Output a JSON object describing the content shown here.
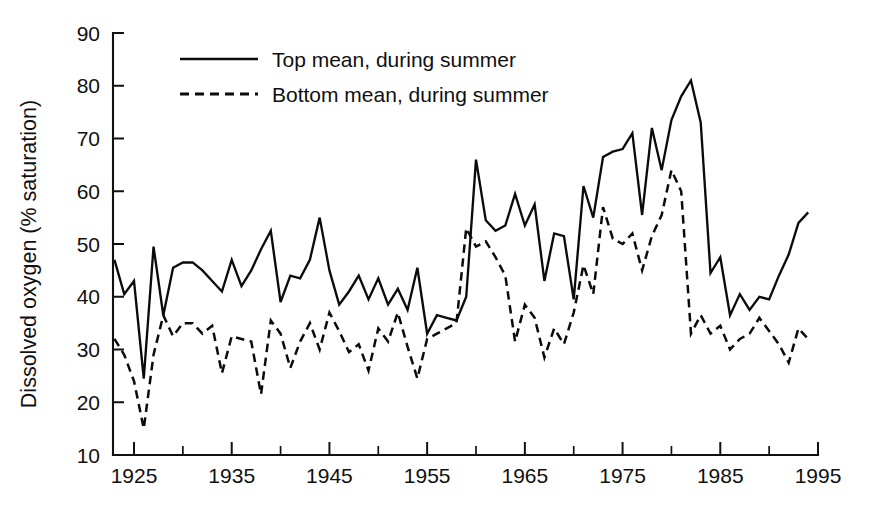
{
  "chart_data": {
    "type": "line",
    "title": "",
    "subtitle": "",
    "xlabel": "",
    "ylabel": "Dissolved oxygen (% saturation)",
    "xlim": [
      1921,
      1995
    ],
    "ylim": [
      10,
      90
    ],
    "grid": false,
    "legend_position": "top-left-inside",
    "y_ticks": [
      10,
      20,
      30,
      40,
      50,
      60,
      70,
      80,
      90
    ],
    "y_tick_labels": [
      "10",
      "20",
      "30",
      "40",
      "50",
      "60",
      "70",
      "80",
      "90"
    ],
    "x_ticks_major": [
      1925,
      1935,
      1945,
      1955,
      1965,
      1975,
      1985,
      1995
    ],
    "x_tick_labels": [
      "1925",
      "1935",
      "1945",
      "1955",
      "1965",
      "1975",
      "1985",
      "1995"
    ],
    "x_ticks_minor": [
      1930,
      1940,
      1950,
      1960,
      1970,
      1980,
      1990
    ],
    "x": [
      1923,
      1924,
      1925,
      1926,
      1927,
      1928,
      1929,
      1930,
      1931,
      1932,
      1933,
      1934,
      1935,
      1936,
      1937,
      1938,
      1939,
      1940,
      1941,
      1942,
      1943,
      1944,
      1945,
      1946,
      1947,
      1948,
      1949,
      1950,
      1951,
      1952,
      1953,
      1954,
      1955,
      1956,
      1957,
      1958,
      1959,
      1960,
      1961,
      1962,
      1963,
      1964,
      1965,
      1966,
      1967,
      1968,
      1969,
      1970,
      1971,
      1972,
      1973,
      1974,
      1975,
      1976,
      1977,
      1978,
      1979,
      1980,
      1981,
      1982,
      1983,
      1984,
      1985,
      1986,
      1987,
      1988,
      1989,
      1990,
      1991,
      1992,
      1993,
      1994
    ],
    "series": [
      {
        "name": "Top mean, during summer",
        "style": "solid",
        "color": "#0b0b0b",
        "values": [
          47.0,
          40.5,
          43.0,
          24.5,
          49.5,
          36.5,
          45.5,
          46.5,
          46.5,
          45.0,
          43.0,
          41.0,
          47.0,
          42.0,
          45.0,
          49.0,
          52.5,
          39.0,
          44.0,
          43.5,
          47.0,
          55.0,
          45.0,
          38.5,
          41.0,
          44.0,
          39.5,
          43.5,
          38.5,
          41.5,
          37.5,
          45.5,
          33.0,
          36.5,
          36.0,
          35.5,
          40.0,
          66.0,
          54.5,
          52.5,
          53.5,
          59.5,
          53.5,
          57.5,
          43.0,
          52.0,
          51.5,
          39.5,
          61.0,
          55.0,
          66.5,
          67.5,
          68.0,
          71.0,
          55.5,
          72.0,
          64.0,
          73.5,
          78.0,
          81.0,
          73.0,
          44.5,
          47.5,
          36.5,
          40.5,
          37.5,
          40.0,
          39.5,
          44.0,
          48.0,
          54.0,
          56.0
        ]
      },
      {
        "name": "Bottom mean, during summer",
        "style": "dashed",
        "color": "#0b0b0b",
        "values": [
          32.0,
          29.0,
          24.0,
          15.0,
          29.0,
          36.5,
          32.5,
          35.0,
          35.0,
          33.0,
          34.5,
          25.5,
          32.5,
          32.0,
          31.5,
          21.5,
          35.5,
          33.0,
          26.5,
          31.5,
          35.0,
          30.0,
          37.0,
          33.5,
          29.5,
          31.0,
          26.0,
          34.0,
          31.5,
          37.0,
          30.5,
          24.5,
          32.0,
          33.0,
          34.0,
          35.0,
          53.0,
          49.5,
          50.5,
          47.5,
          44.0,
          31.5,
          38.5,
          36.0,
          28.5,
          34.0,
          31.0,
          37.0,
          46.0,
          40.5,
          57.0,
          51.0,
          50.0,
          52.0,
          45.0,
          51.5,
          55.5,
          64.0,
          60.0,
          33.0,
          36.5,
          33.0,
          34.5,
          30.0,
          32.0,
          33.0,
          36.0,
          33.5,
          31.0,
          27.5,
          34.0,
          32.0
        ]
      }
    ]
  },
  "legend": {
    "entries": [
      {
        "label": "Top mean, during summer",
        "style": "solid"
      },
      {
        "label": "Bottom mean, during summer",
        "style": "dashed"
      }
    ]
  },
  "axes": {
    "y_axis_title": "Dissolved oxygen (% saturation)"
  }
}
